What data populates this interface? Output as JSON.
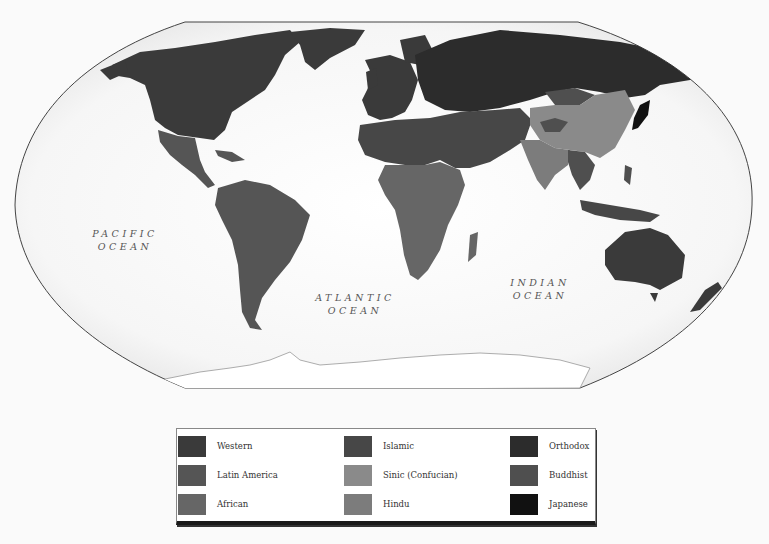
{
  "map": {
    "title": "",
    "projection": "world-oval",
    "ocean_labels": [
      {
        "line1": "PACIFIC",
        "line2": "OCEAN"
      },
      {
        "line1": "ATLANTIC",
        "line2": "OCEAN"
      },
      {
        "line1": "INDIAN",
        "line2": "OCEAN"
      }
    ],
    "colors": {
      "background": "#fafafa",
      "ocean": "#f4f4f4",
      "antarctica": "#ffffff",
      "border": "#444444"
    },
    "regions": [
      {
        "name": "North America",
        "civilization": "Western"
      },
      {
        "name": "Greenland",
        "civilization": "Western"
      },
      {
        "name": "Mexico & Central America",
        "civilization": "Latin America"
      },
      {
        "name": "South America",
        "civilization": "Latin America"
      },
      {
        "name": "Western Europe",
        "civilization": "Western"
      },
      {
        "name": "Russia",
        "civilization": "Orthodox"
      },
      {
        "name": "North Africa & Middle East",
        "civilization": "Islamic"
      },
      {
        "name": "Sub-Saharan Africa",
        "civilization": "African"
      },
      {
        "name": "China",
        "civilization": "Sinic (Confucian)"
      },
      {
        "name": "Mongolia & Tibet",
        "civilization": "Buddhist"
      },
      {
        "name": "India",
        "civilization": "Hindu"
      },
      {
        "name": "Japan",
        "civilization": "Japanese"
      },
      {
        "name": "Southeast Asia",
        "civilization": "Buddhist"
      },
      {
        "name": "Indonesia",
        "civilization": "Islamic"
      },
      {
        "name": "Australia",
        "civilization": "Western"
      },
      {
        "name": "New Zealand",
        "civilization": "Western"
      }
    ]
  },
  "legend": {
    "items": [
      {
        "label": "Western",
        "color": "#3a3a3a"
      },
      {
        "label": "Latin America",
        "color": "#555555"
      },
      {
        "label": "African",
        "color": "#666666"
      },
      {
        "label": "Islamic",
        "color": "#474747"
      },
      {
        "label": "Sinic (Confucian)",
        "color": "#8a8a8a"
      },
      {
        "label": "Hindu",
        "color": "#7c7c7c"
      },
      {
        "label": "Orthodox",
        "color": "#2c2c2c"
      },
      {
        "label": "Buddhist",
        "color": "#4f4f4f"
      },
      {
        "label": "Japanese",
        "color": "#111111"
      }
    ]
  }
}
